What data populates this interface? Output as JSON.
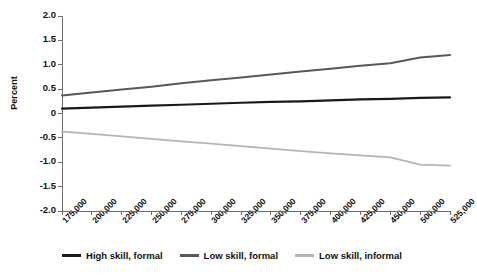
{
  "chart_data": {
    "type": "line",
    "title": "",
    "xlabel": "",
    "ylabel": "Percent",
    "ylim": [
      -2.0,
      2.0
    ],
    "yticks": [
      "2.0",
      "1.5",
      "1.0",
      "0.5",
      "0",
      "-0.5",
      "-1.0",
      "-1.5",
      "-2.0"
    ],
    "ytick_values": [
      2.0,
      1.5,
      1.0,
      0.5,
      0,
      -0.5,
      -1.0,
      -1.5,
      -2.0
    ],
    "grid": false,
    "legend_position": "bottom",
    "categories": [
      "175,000",
      "200,000",
      "225,000",
      "250,000",
      "275,000",
      "300,000",
      "325,000",
      "350,000",
      "375,000",
      "400,000",
      "425,000",
      "450,000",
      "500,000",
      "525,000"
    ],
    "x": [
      175000,
      200000,
      225000,
      250000,
      275000,
      300000,
      325000,
      350000,
      375000,
      400000,
      425000,
      450000,
      500000,
      525000
    ],
    "series": [
      {
        "name": "High skill, formal",
        "color": "#1a1a1a",
        "values": [
          0.1,
          0.12,
          0.14,
          0.16,
          0.18,
          0.2,
          0.22,
          0.24,
          0.25,
          0.27,
          0.29,
          0.3,
          0.32,
          0.33
        ]
      },
      {
        "name": "Low skill, formal",
        "color": "#595959",
        "values": [
          0.37,
          0.43,
          0.49,
          0.55,
          0.62,
          0.68,
          0.74,
          0.8,
          0.86,
          0.92,
          0.98,
          1.03,
          1.15,
          1.2
        ]
      },
      {
        "name": "Low skill, informal",
        "color": "#b5b5b5",
        "values": [
          -0.37,
          -0.42,
          -0.47,
          -0.52,
          -0.57,
          -0.62,
          -0.67,
          -0.72,
          -0.77,
          -0.82,
          -0.86,
          -0.9,
          -1.05,
          -1.07
        ]
      }
    ]
  },
  "legend": {
    "items": [
      {
        "label": "High skill, formal",
        "color": "#1a1a1a"
      },
      {
        "label": "Low skill, formal",
        "color": "#595959"
      },
      {
        "label": "Low skill, informal",
        "color": "#b5b5b5"
      }
    ]
  },
  "axes": {
    "y_title": "Percent"
  }
}
